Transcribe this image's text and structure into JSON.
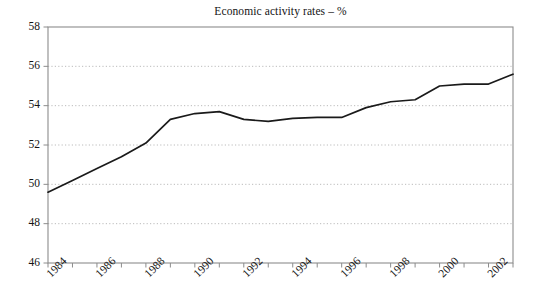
{
  "chart_data": {
    "type": "line",
    "title": "Economic activity rates – %",
    "xlabel": "",
    "ylabel": "",
    "xlim": [
      1984,
      2003
    ],
    "ylim": [
      46,
      58
    ],
    "grid": true,
    "legend": false,
    "y_ticks": [
      46,
      48,
      50,
      52,
      54,
      56,
      58
    ],
    "x_ticks": [
      1984,
      1985,
      1986,
      1987,
      1988,
      1989,
      1990,
      1991,
      1992,
      1993,
      1994,
      1995,
      1996,
      1997,
      1998,
      1999,
      2000,
      2001,
      2002,
      2003
    ],
    "x_tick_labels": [
      "1984",
      "",
      "1986",
      "",
      "1988",
      "",
      "1990",
      "",
      "1992",
      "",
      "1994",
      "",
      "1996",
      "",
      "1998",
      "",
      "2000",
      "",
      "2002",
      ""
    ],
    "x": [
      1984,
      1985,
      1986,
      1987,
      1988,
      1989,
      1990,
      1991,
      1992,
      1993,
      1994,
      1995,
      1996,
      1997,
      1998,
      1999,
      2000,
      2001,
      2002,
      2003
    ],
    "values": [
      49.6,
      50.2,
      50.8,
      51.4,
      52.1,
      53.3,
      53.6,
      53.7,
      53.3,
      53.2,
      53.35,
      53.4,
      53.4,
      53.9,
      54.2,
      54.3,
      55.0,
      55.1,
      55.1,
      55.6
    ],
    "line_color": "#1a1a1a",
    "grid_color": "#b4b4b4",
    "axis_color": "#8c8c8c",
    "background_color": "#ffffff"
  },
  "axis": {
    "y_labels": [
      "58",
      "56",
      "54",
      "52",
      "50",
      "48",
      "46"
    ],
    "x_labels": [
      "1984",
      "1986",
      "1988",
      "1990",
      "1992",
      "1994",
      "1996",
      "1998",
      "2000",
      "2002"
    ]
  }
}
